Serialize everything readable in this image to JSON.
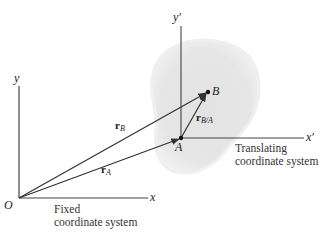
{
  "diagram": {
    "type": "relative-motion-translating-axes",
    "fixed_frame": {
      "origin_label": "O",
      "x_axis_label": "x",
      "y_axis_label": "y",
      "caption_line1": "Fixed",
      "caption_line2": "coordinate system"
    },
    "translating_frame": {
      "x_axis_label": "x′",
      "y_axis_label": "y′",
      "caption_line1": "Translating",
      "caption_line2": "coordinate system"
    },
    "points": {
      "A": "A",
      "B": "B"
    },
    "vectors": {
      "rA": {
        "symbol": "r",
        "subscript": "A"
      },
      "rB": {
        "symbol": "r",
        "subscript": "B"
      },
      "rBA": {
        "symbol": "r",
        "subscript": "B/A"
      }
    },
    "colors": {
      "line": "#333333",
      "body_fill": "#e4e4e4",
      "body_edge": "#f2f2f2"
    }
  }
}
